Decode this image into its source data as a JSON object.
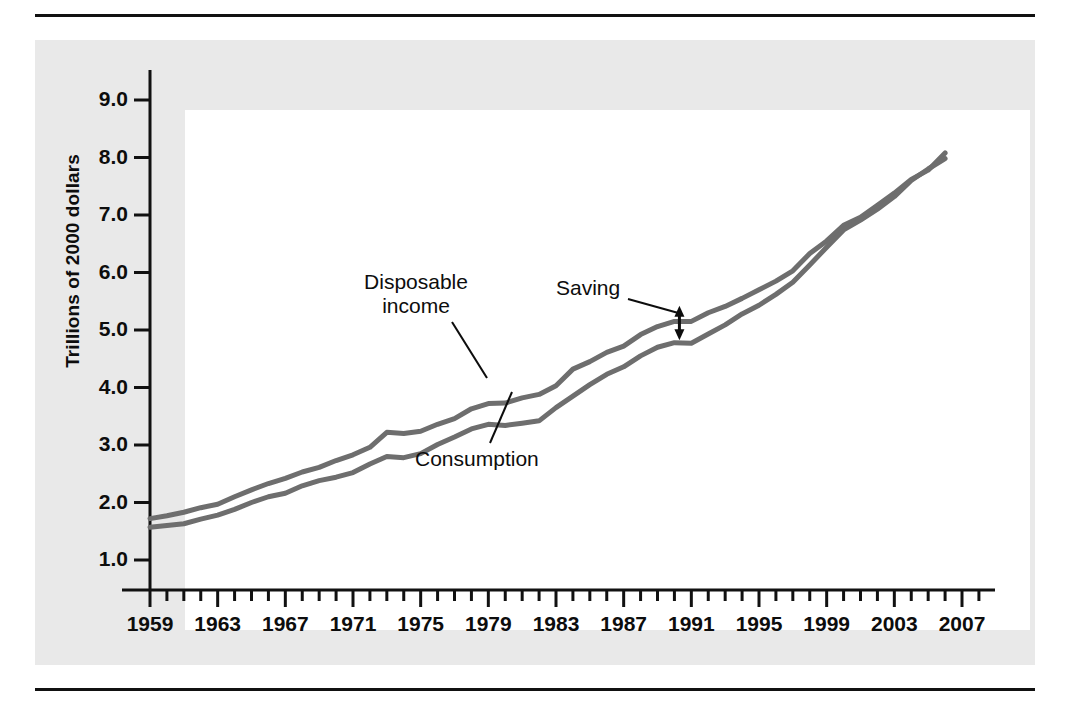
{
  "chart_data": {
    "type": "line",
    "title": "",
    "xlabel": "",
    "ylabel": "Trillions of 2000 dollars",
    "xlim": [
      1959,
      2008
    ],
    "ylim": [
      0,
      9.6
    ],
    "yticks": [
      "9.0",
      "8.0",
      "7.0",
      "6.0",
      "5.0",
      "4.0",
      "3.0",
      "2.0",
      "1.0"
    ],
    "ytick_values": [
      9.0,
      8.0,
      7.0,
      6.0,
      5.0,
      4.0,
      3.0,
      2.0,
      1.0
    ],
    "xticks": [
      "1959",
      "1963",
      "1967",
      "1971",
      "1975",
      "1979",
      "1983",
      "1987",
      "1991",
      "1995",
      "1999",
      "2003",
      "2007"
    ],
    "xtick_values": [
      1959,
      1963,
      1967,
      1971,
      1975,
      1979,
      1983,
      1987,
      1991,
      1995,
      1999,
      2003,
      2007
    ],
    "minor_xticks_every": 1,
    "grid": false,
    "legend": "inline-annotations",
    "line_color": "#6e6e6e",
    "axis_color": "#111111",
    "x": [
      1959,
      1960,
      1961,
      1962,
      1963,
      1964,
      1965,
      1966,
      1967,
      1968,
      1969,
      1970,
      1971,
      1972,
      1973,
      1974,
      1975,
      1976,
      1977,
      1978,
      1979,
      1980,
      1981,
      1982,
      1983,
      1984,
      1985,
      1986,
      1987,
      1988,
      1989,
      1990,
      1991,
      1992,
      1993,
      1994,
      1995,
      1996,
      1997,
      1998,
      1999,
      2000,
      2001,
      2002,
      2003,
      2004,
      2005,
      2006
    ],
    "series": [
      {
        "name": "Disposable income",
        "values": [
          1.72,
          1.77,
          1.83,
          1.91,
          1.97,
          2.1,
          2.22,
          2.33,
          2.42,
          2.53,
          2.61,
          2.73,
          2.83,
          2.96,
          3.22,
          3.2,
          3.24,
          3.36,
          3.46,
          3.63,
          3.72,
          3.73,
          3.82,
          3.88,
          4.03,
          4.32,
          4.45,
          4.61,
          4.72,
          4.92,
          5.06,
          5.15,
          5.15,
          5.3,
          5.41,
          5.55,
          5.7,
          5.85,
          6.03,
          6.33,
          6.55,
          6.82,
          6.96,
          7.17,
          7.38,
          7.62,
          7.78,
          8.08
        ],
        "endpoint_value": 8.08,
        "start_value": 1.72
      },
      {
        "name": "Consumption",
        "values": [
          1.57,
          1.6,
          1.63,
          1.71,
          1.78,
          1.88,
          2.0,
          2.1,
          2.16,
          2.29,
          2.38,
          2.44,
          2.52,
          2.67,
          2.8,
          2.78,
          2.85,
          3.01,
          3.14,
          3.28,
          3.36,
          3.34,
          3.38,
          3.42,
          3.65,
          3.85,
          4.05,
          4.23,
          4.36,
          4.55,
          4.7,
          4.78,
          4.77,
          4.93,
          5.09,
          5.28,
          5.43,
          5.62,
          5.83,
          6.13,
          6.44,
          6.74,
          6.91,
          7.1,
          7.32,
          7.6,
          7.8,
          7.98
        ],
        "endpoint_value": 7.98,
        "start_value": 1.57
      }
    ],
    "annotations": [
      {
        "name": "disposable-income",
        "text_line1": "Disposable",
        "text_line2": "income",
        "points_to_series": "Disposable income",
        "points_to_year": 1977
      },
      {
        "name": "consumption",
        "text_line1": "Consumption",
        "text_line2": "",
        "points_to_series": "Consumption",
        "points_to_year": 1979
      },
      {
        "name": "saving",
        "text_line1": "Saving",
        "text_line2": "",
        "points_to_gap_year": 1990,
        "marker": "double-headed-arrow",
        "gap_top": 5.42,
        "gap_bottom": 4.82
      }
    ]
  },
  "figure": {
    "y_axis_title": "Trillions of 2000 dollars",
    "annotation_disposable_line1": "Disposable",
    "annotation_disposable_line2": "income",
    "annotation_consumption": "Consumption",
    "annotation_saving": "Saving"
  }
}
